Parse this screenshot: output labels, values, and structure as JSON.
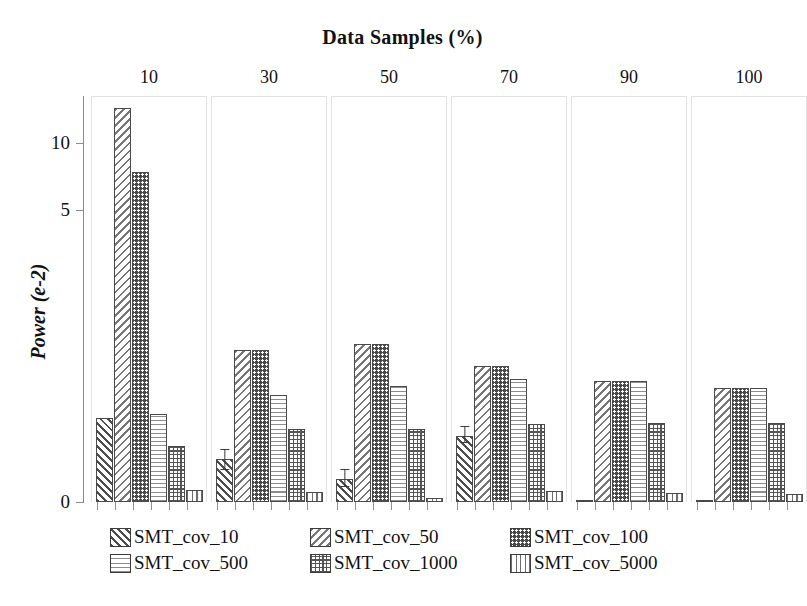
{
  "chart_data": {
    "type": "bar",
    "title": "Data Samples (%)",
    "xlabel": "Data Samples (%)",
    "ylabel": "Power (e-2)",
    "categories": [
      "10",
      "30",
      "50",
      "70",
      "90",
      "100"
    ],
    "ytick_labels": [
      "0",
      "5",
      "10"
    ],
    "ytick_values": [
      0,
      5,
      10
    ],
    "ylim": [
      0,
      12
    ],
    "grid": false,
    "legend_position": "bottom",
    "note": "Vertical axis is visually compressed above 5; bar heights read off the plotted pixels.",
    "series": [
      {
        "name": "SMT_cov_10",
        "pattern": "diagonal-up-hatch",
        "values": [
          3.0,
          2.0,
          1.75,
          2.6,
          1.35,
          0.85
        ]
      },
      {
        "name": "SMT_cov_50",
        "pattern": "diagonal-down-hatch",
        "values": [
          11.4,
          5.4,
          4.2,
          3.6,
          3.2,
          3.1
        ]
      },
      {
        "name": "SMT_cov_100",
        "pattern": "dark-dots",
        "values": [
          8.1,
          5.4,
          4.2,
          3.6,
          3.2,
          3.1
        ]
      },
      {
        "name": "SMT_cov_500",
        "pattern": "horizontal-lines",
        "values": [
          3.05,
          3.25,
          3.3,
          3.4,
          3.2,
          3.1
        ]
      },
      {
        "name": "SMT_cov_1000",
        "pattern": "cross-hatch-grid",
        "values": [
          2.4,
          2.55,
          2.6,
          2.6,
          2.5,
          2.45
        ]
      },
      {
        "name": "SMT_cov_5000",
        "pattern": "vertical-lines",
        "values": [
          1.75,
          1.7,
          1.7,
          1.8,
          1.75,
          1.65
        ]
      }
    ],
    "error_bars": [
      {
        "group": "30",
        "series": "SMT_cov_10",
        "low": 1.75,
        "high": 2.3
      },
      {
        "group": "50",
        "series": "SMT_cov_10",
        "low": 1.6,
        "high": 2.0
      },
      {
        "group": "70",
        "series": "SMT_cov_10",
        "low": 2.45,
        "high": 2.75
      }
    ],
    "bar_pixels": {
      "baseline_y": 406,
      "groups": [
        {
          "label": "10",
          "left": 8,
          "width": 116,
          "tops": [
            322,
            12,
            76,
            318,
            350,
            394
          ],
          "err": null
        },
        {
          "label": "30",
          "left": 128,
          "width": 116,
          "tops": [
            363,
            254,
            254,
            299,
            333,
            396
          ],
          "err": {
            "index": 0,
            "top": 354,
            "bottom": 375
          }
        },
        {
          "label": "50",
          "left": 248,
          "width": 116,
          "tops": [
            383,
            248,
            248,
            290,
            333,
            402
          ],
          "err": {
            "index": 0,
            "top": 374,
            "bottom": 392
          }
        },
        {
          "label": "70",
          "left": 368,
          "width": 116,
          "tops": [
            340,
            270,
            270,
            283,
            328,
            395
          ],
          "err": {
            "index": 0,
            "top": 331,
            "bottom": 348
          }
        },
        {
          "label": "90",
          "left": 488,
          "width": 116,
          "tops": [
            425,
            285,
            285,
            285,
            327,
            397
          ],
          "err": null
        },
        {
          "label": "100",
          "left": 608,
          "width": 116,
          "tops": [
            453,
            292,
            292,
            292,
            327,
            398
          ],
          "err": null
        }
      ]
    }
  },
  "legend": {
    "rows": [
      [
        {
          "label": "SMT_cov_10",
          "pattern": "p-diag-up"
        },
        {
          "label": "SMT_cov_50",
          "pattern": "p-diag-down"
        },
        {
          "label": "SMT_cov_100",
          "pattern": "p-dots"
        }
      ],
      [
        {
          "label": "SMT_cov_500",
          "pattern": "p-horiz"
        },
        {
          "label": "SMT_cov_1000",
          "pattern": "p-grid"
        },
        {
          "label": "SMT_cov_5000",
          "pattern": "p-vert"
        }
      ]
    ]
  },
  "colors": {
    "background": "#ffffff",
    "axis": "#8a8a8a",
    "text": "#111111",
    "bar_outline": "#4a4a4a",
    "group_box": "#e2e2e2"
  }
}
